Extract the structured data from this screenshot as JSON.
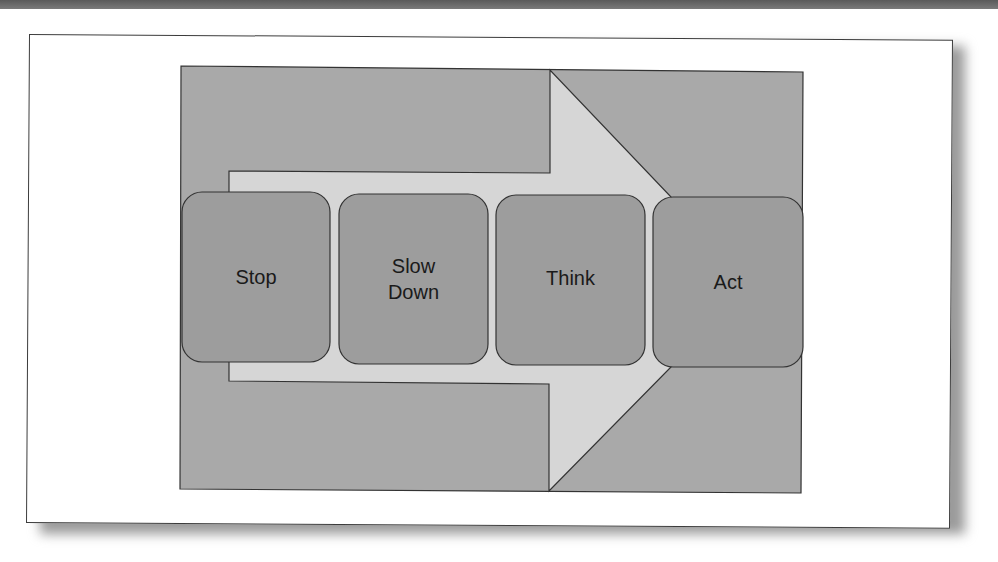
{
  "diagram": {
    "type": "process-arrow",
    "colors": {
      "background_panel": "#a9a9a9",
      "arrow_fill": "#d6d6d6",
      "step_fill": "#9d9d9d",
      "outline": "#333333",
      "frame": "#ffffff",
      "top_bar": "#666666"
    },
    "steps": [
      {
        "label": "Stop"
      },
      {
        "label": "Slow\nDown"
      },
      {
        "label": "Think"
      },
      {
        "label": "Act"
      }
    ]
  }
}
